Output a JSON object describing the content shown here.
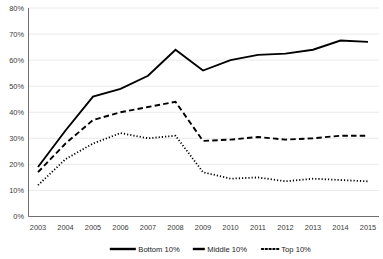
{
  "chart_data": {
    "type": "line",
    "title": "",
    "xlabel": "",
    "ylabel": "",
    "categories": [
      "2003",
      "2004",
      "2005",
      "2006",
      "2007",
      "2008",
      "2009",
      "2010",
      "2011",
      "2012",
      "2013",
      "2014",
      "2015"
    ],
    "x": [
      2003,
      2004,
      2005,
      2006,
      2007,
      2008,
      2009,
      2010,
      2011,
      2012,
      2013,
      2014,
      2015
    ],
    "ylim": [
      0,
      80
    ],
    "yticks": [
      "0%",
      "10%",
      "20%",
      "30%",
      "40%",
      "50%",
      "60%",
      "70%",
      "80%"
    ],
    "ytick_values": [
      0,
      10,
      20,
      30,
      40,
      50,
      60,
      70,
      80
    ],
    "grid": true,
    "legend_position": "bottom",
    "series": [
      {
        "name": "Bottom 10%",
        "style": "solid",
        "color": "#000000",
        "values": [
          19,
          33,
          46,
          49,
          54,
          64,
          56,
          60,
          62,
          62.5,
          64,
          67.5,
          67
        ]
      },
      {
        "name": "Middle 10%",
        "style": "dashed",
        "color": "#000000",
        "values": [
          17,
          28,
          37,
          40,
          42,
          44,
          29,
          29.5,
          30.5,
          29.5,
          30,
          31,
          31
        ]
      },
      {
        "name": "Top 10%",
        "style": "dotted",
        "color": "#000000",
        "values": [
          12,
          22,
          28,
          32,
          30,
          31,
          17,
          14.5,
          15,
          13.5,
          14.5,
          14,
          13.5
        ]
      }
    ]
  },
  "legend": {
    "items": [
      {
        "label": "Bottom 10%",
        "style": "solid"
      },
      {
        "label": "Middle 10%",
        "style": "dashed"
      },
      {
        "label": "Top 10%",
        "style": "dotted"
      }
    ]
  }
}
